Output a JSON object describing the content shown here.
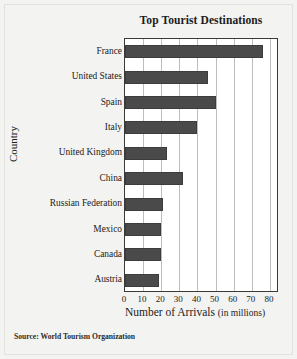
{
  "figure": {
    "source_note": "Source: World Tourism Organization",
    "bar_color": "#4a4a4a",
    "plot_background": "#ffffff",
    "page_background": "#f3f3f1",
    "gridline_color": "#bdbdbd"
  },
  "chart_data": {
    "type": "bar",
    "orientation": "horizontal",
    "title": "Top Tourist Destinations",
    "xlabel": "Number of Arrivals",
    "xlabel_unit": "(in millions)",
    "ylabel": "Country",
    "categories": [
      "France",
      "United States",
      "Spain",
      "Italy",
      "United Kingdom",
      "China",
      "Russian Federation",
      "Mexico",
      "Canada",
      "Austria"
    ],
    "values": [
      76,
      46,
      50,
      40,
      23,
      32,
      21,
      20,
      20,
      19
    ],
    "xlim": [
      0,
      85
    ],
    "xticks": [
      0,
      10,
      20,
      30,
      40,
      50,
      60,
      70,
      80
    ],
    "xtick_labels": [
      "0",
      "10",
      "20",
      "30",
      "40",
      "50",
      "60",
      "70",
      "80"
    ],
    "grid": "vertical",
    "legend": "none"
  }
}
